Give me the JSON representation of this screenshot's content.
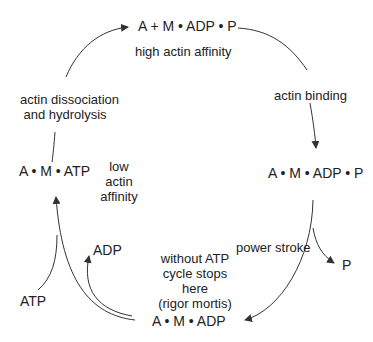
{
  "states": {
    "top": "A + M • ADP • P",
    "right": "A • M • ADP • P",
    "bottom": "A • M • ADP",
    "left": "A • M • ATP"
  },
  "annotations": {
    "top_affinity": "high actin affinity",
    "left_affinity_1": "low",
    "left_affinity_2": "actin",
    "left_affinity_3": "affinity",
    "rigor_1": "without ATP",
    "rigor_2": "cycle stops",
    "rigor_3": "here",
    "rigor_4": "(rigor mortis)"
  },
  "transitions": {
    "actin_binding": "actin binding",
    "power_stroke": "power stroke",
    "dissociation_1": "actin dissociation",
    "dissociation_2": "and hydrolysis"
  },
  "molecules": {
    "p_release": "P",
    "adp_release": "ADP",
    "atp_in": "ATP"
  },
  "colors": {
    "line": "#333333",
    "text": "#222222"
  }
}
